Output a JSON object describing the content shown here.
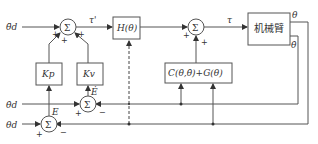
{
  "diagram": {
    "title": "",
    "inputs": {
      "accel_ref": "θ̈d",
      "vel_ref": "θ̇d",
      "pos_ref": "θd"
    },
    "signals": {
      "tau_prime": "τ'",
      "tau": "τ",
      "error": "E",
      "error_dot": "Ė",
      "theta": "θ",
      "theta_dot": "θ̇"
    },
    "blocks": {
      "sum_symbol": "Σ",
      "inertia": "H(θ)",
      "robot_arm": "机械臂",
      "kp": "Kp",
      "kv": "Kv",
      "coriolis_gravity": "C(θ,θ̇)+G(θ)"
    },
    "signs": {
      "plus": "+",
      "minus": "−"
    }
  }
}
